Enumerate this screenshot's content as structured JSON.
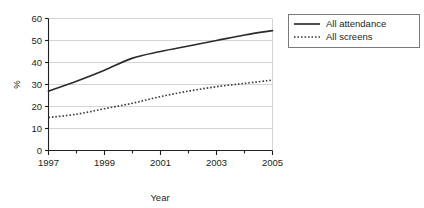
{
  "chart_data": {
    "type": "line",
    "title": "",
    "xlabel": "Year",
    "ylabel": "%",
    "xlim": [
      1997,
      2005
    ],
    "ylim": [
      0,
      60
    ],
    "ytick_values": [
      0,
      10,
      20,
      30,
      40,
      50,
      60
    ],
    "ytick_labels": [
      "0",
      "10",
      "20",
      "30",
      "40",
      "50",
      "60"
    ],
    "xtick_values": [
      1997,
      1998,
      1999,
      2000,
      2001,
      2002,
      2003,
      2004,
      2005
    ],
    "xtick_labels": [
      "1997",
      "",
      "1999",
      "",
      "2001",
      "",
      "2003",
      "",
      "2005"
    ],
    "xtick_labels_shown": [
      "1997",
      "1999",
      "2001",
      "2003",
      "2005"
    ],
    "grid": "horizontal",
    "legend_position": "top-right-outside",
    "x": [
      1997,
      1998,
      1999,
      2000,
      2001,
      2002,
      2003,
      2004,
      2005
    ],
    "series": [
      {
        "name": "All attendance",
        "style": "solid",
        "color": "#2b2b2b",
        "values": [
          27,
          31.5,
          36.5,
          42,
          45,
          47.5,
          50,
          52.5,
          54.5
        ]
      },
      {
        "name": "All screens",
        "style": "dotted",
        "color": "#3a3a3a",
        "values": [
          15,
          16.5,
          19,
          21.5,
          24.5,
          27,
          29,
          30.5,
          32
        ]
      }
    ]
  },
  "legend": {
    "items": [
      {
        "label": "All attendance",
        "style": "solid"
      },
      {
        "label": "All screens",
        "style": "dotted"
      }
    ]
  },
  "axis": {
    "y_title": "%",
    "x_title": "Year"
  },
  "colors": {
    "axis": "#231f20",
    "grid": "#d4d4d4",
    "series_solid": "#2b2b2b",
    "series_dotted": "#3a3a3a",
    "legend_border": "#7a7a7a"
  }
}
